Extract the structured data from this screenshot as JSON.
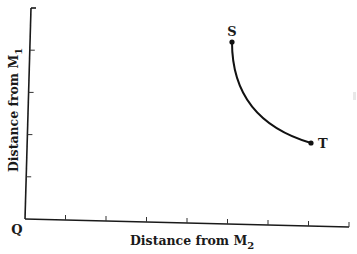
{
  "diagram": {
    "origin_label": "Q",
    "x_axis": {
      "label": "Distance from M",
      "label_subscript": "2",
      "tick_count": 8
    },
    "y_axis": {
      "label": "Distance from M",
      "label_subscript": "1",
      "tick_count": 4
    },
    "curve": {
      "description": "concave-up arc from S to T",
      "start": {
        "label": "S",
        "x": 5.05,
        "y": 4.1
      },
      "end": {
        "label": "T",
        "x": 7.0,
        "y": 1.8
      }
    },
    "colors": {
      "ink": "#111111",
      "background": "#ffffff"
    }
  }
}
